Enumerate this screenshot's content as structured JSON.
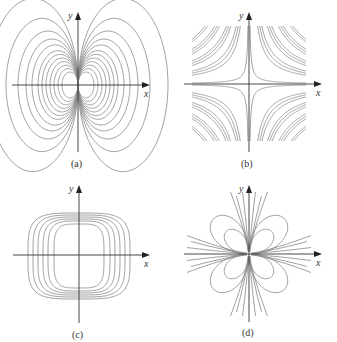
{
  "figure": {
    "panels": [
      {
        "id": "a",
        "caption": "(a)",
        "x_label": "x",
        "y_label": "y",
        "description": "dipole-like family of nested loops tangent at origin, left and right lobes"
      },
      {
        "id": "b",
        "caption": "(b)",
        "x_label": "x",
        "y_label": "y",
        "description": "hyperbolas xy = c in all four quadrants, clipped to a square"
      },
      {
        "id": "c",
        "caption": "(c)",
        "x_label": "x",
        "y_label": "y",
        "description": "nested rounded-square closed curves centered at origin"
      },
      {
        "id": "d",
        "caption": "(d)",
        "x_label": "x",
        "y_label": "y",
        "description": "four-petal loops in each quadrant with curves through the origin"
      }
    ]
  },
  "colors": {
    "curve": "#8a8a8a",
    "axis": "#333333",
    "background": "#ffffff"
  }
}
